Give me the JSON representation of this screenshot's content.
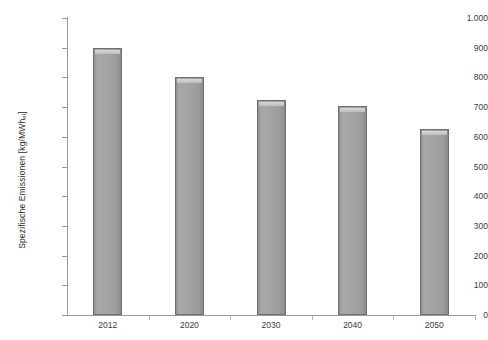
{
  "chart_data": {
    "type": "bar",
    "title": "",
    "subtitle": "",
    "xlabel": "",
    "ylabel": "Spezifische Emissionen [kg/MWh",
    "ylabel_subscript": "el",
    "ylabel_suffix": "]",
    "categories": [
      "2012",
      "2020",
      "2030",
      "2040",
      "2050"
    ],
    "values": [
      900,
      800,
      725,
      705,
      625
    ],
    "series": [
      {
        "name": "Spezifische Emissionen",
        "values": [
          900,
          800,
          725,
          705,
          625
        ]
      }
    ],
    "ylim": [
      0,
      1000
    ],
    "ytick_values": [
      0,
      100,
      200,
      300,
      400,
      500,
      600,
      700,
      800,
      900,
      1000
    ],
    "ytick_labels": [
      "0",
      "100",
      "200",
      "300",
      "400",
      "500",
      "600",
      "700",
      "800",
      "900",
      "1.000"
    ],
    "grid": false,
    "legend": false,
    "legend_position": "none",
    "bar_color": "#a3a3a3",
    "bar_edge_color": "#6f6f6f",
    "axis_color": "#9a9a9a",
    "background_color": "#ffffff"
  }
}
